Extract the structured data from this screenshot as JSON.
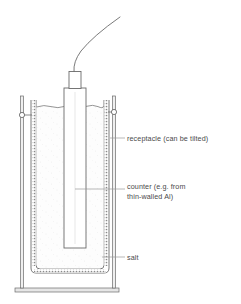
{
  "figure": {
    "kind": "scientific-apparatus-diagram",
    "title": "",
    "background_color": "#ffffff",
    "line_color": "#6b6b6b",
    "dark_line_color": "#555555",
    "text_color": "#4a4a4a",
    "fill_color": "#ffffff",
    "salt_fill_color": "#fcfcfc",
    "hatch_color": "#777777"
  },
  "labels": [
    {
      "id": "receptacle",
      "text": "receptacle (can be tilted)",
      "lines": [
        "receptacle (can be tilted)"
      ],
      "text_x": 127,
      "text_y": 141,
      "leader_from_x": 110,
      "leader_from_y": 138,
      "leader_to_x": 125,
      "leader_to_y": 138
    },
    {
      "id": "counter",
      "text": "counter (e.g. from thin-walled Al)",
      "lines": [
        "counter (e.g. from",
        "thin-walled Al)"
      ],
      "text_x": 127,
      "text_y": 192,
      "leader_from_x": 110,
      "leader_from_y": 189,
      "leader_to_x": 125,
      "leader_to_y": 189
    },
    {
      "id": "salt",
      "text": "salt",
      "lines": [
        "salt"
      ],
      "text_x": 127,
      "text_y": 260,
      "leader_from_x": 110,
      "leader_from_y": 257,
      "leader_to_x": 125,
      "leader_to_y": 257
    }
  ],
  "parts": {
    "cable": "signal-cable",
    "connector": "connector-block",
    "counter_tube": "counter-tube",
    "receptacle": "receptacle-vessel",
    "salt": "salt-fill",
    "salt_surface": "salt-surface-line",
    "stand_rod_left": "stand-rod-left",
    "stand_rod_right": "stand-rod-right",
    "clamp_left": "clamp-ring-left",
    "clamp_right": "clamp-ring-right",
    "stand_base": "stand-base"
  },
  "geometry": {
    "receptacle_outer": {
      "x": 31,
      "y": 100,
      "w": 78,
      "h": 173
    },
    "receptacle_inner": {
      "x": 36,
      "y": 103,
      "w": 68,
      "h": 166
    },
    "counter_tube": {
      "x": 64,
      "y": 88,
      "w": 22,
      "h": 160
    },
    "connector": {
      "x": 69,
      "y": 72,
      "w": 12,
      "h": 17
    },
    "stand_base": {
      "x": 15,
      "y": 288,
      "w": 104,
      "h": 4
    },
    "rod_left_x": 22,
    "rod_right_x": 114,
    "rod_top_y": 96,
    "rod_bottom_y": 288,
    "clamp_left": {
      "cx": 22,
      "cy": 115,
      "r": 2.6
    },
    "clamp_right": {
      "cx": 114,
      "cy": 112,
      "r": 2.6
    },
    "salt_level_y": 107
  }
}
